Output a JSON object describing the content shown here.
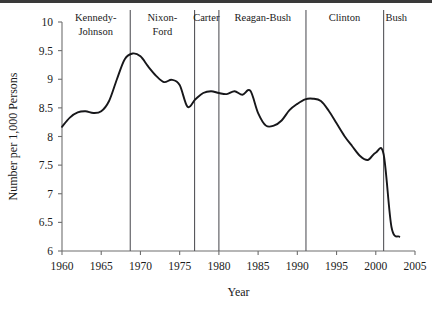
{
  "figure": {
    "title": "",
    "background": "#ffffff",
    "top_rule_color": "#3a3a3a"
  },
  "axis": {
    "xlabel": "Year",
    "ylabel": "Number per 1,000 Persons",
    "x_ticks": [
      "1960",
      "1965",
      "1970",
      "1975",
      "1980",
      "1985",
      "1990",
      "1995",
      "2000",
      "2005"
    ],
    "y_ticks": [
      "6",
      "6.5",
      "7",
      "7.5",
      "8",
      "8.5",
      "9",
      "9.5",
      "10"
    ],
    "line_color": "#6e6e6e"
  },
  "eras": [
    {
      "label": "Kennedy-",
      "label2": "Johnson",
      "start": 1960.0,
      "end": 1968.7,
      "center": 1964.3
    },
    {
      "label": "Nixon-",
      "label2": "Ford",
      "start": 1968.7,
      "end": 1976.9,
      "center": 1972.8
    },
    {
      "label": "Carter",
      "label2": "",
      "start": 1976.9,
      "end": 1980.0,
      "center": 1978.4
    },
    {
      "label": "Reagan-Bush",
      "label2": "",
      "start": 1980.0,
      "end": 1991.1,
      "center": 1985.6
    },
    {
      "label": "Clinton",
      "label2": "",
      "start": 1991.1,
      "end": 2001.0,
      "center": 1996.0
    },
    {
      "label": "Bush",
      "label2": "",
      "start": 2001.0,
      "end": 2004.3,
      "center": 2002.6
    }
  ],
  "era_divider_years": [
    1968.7,
    1976.9,
    1980.0,
    1991.1,
    2001.0
  ],
  "chart_data": {
    "type": "line",
    "title": "",
    "xlabel": "Year",
    "ylabel": "Number per 1,000 Persons",
    "xlim": [
      1960,
      2005
    ],
    "ylim": [
      6,
      10
    ],
    "grid": false,
    "legend": null,
    "series_color": "#17171a",
    "x": [
      1960,
      1961,
      1962,
      1963,
      1964,
      1965,
      1966,
      1967,
      1968,
      1969,
      1970,
      1971,
      1972,
      1973,
      1974,
      1975,
      1976,
      1977,
      1978,
      1979,
      1980,
      1981,
      1982,
      1983,
      1984,
      1985,
      1986,
      1987,
      1988,
      1989,
      1990,
      1991,
      1992,
      1993,
      1994,
      1995,
      1996,
      1997,
      1998,
      1999,
      2000,
      2001,
      2002,
      2003
    ],
    "values": [
      8.17,
      8.33,
      8.42,
      8.44,
      8.41,
      8.44,
      8.62,
      9.0,
      9.35,
      9.45,
      9.4,
      9.22,
      9.06,
      8.95,
      8.99,
      8.9,
      8.52,
      8.65,
      8.76,
      8.79,
      8.76,
      8.74,
      8.79,
      8.73,
      8.8,
      8.41,
      8.19,
      8.19,
      8.28,
      8.46,
      8.57,
      8.65,
      8.66,
      8.62,
      8.45,
      8.23,
      8.01,
      7.83,
      7.66,
      7.59,
      7.72,
      7.69,
      6.42,
      6.25
    ]
  }
}
